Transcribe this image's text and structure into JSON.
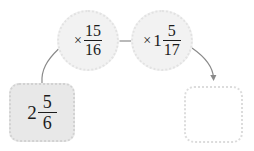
{
  "diagram": {
    "type": "function-machine",
    "title": "",
    "start": {
      "label": "2 5/6",
      "whole": "2",
      "numerator": "5",
      "denominator": "6"
    },
    "operations": [
      {
        "label": "× 15/16",
        "sign": "×",
        "whole": "",
        "numerator": "15",
        "denominator": "16"
      },
      {
        "label": "×1 5/17",
        "sign": "×",
        "whole": "1",
        "numerator": "5",
        "denominator": "17"
      }
    ],
    "answer": {
      "value": "",
      "placeholder": ""
    },
    "colors": {
      "circle_fill": "#f2f2f2",
      "circle_border": "#e2e2e2",
      "start_box_fill": "#e8e8e8",
      "start_box_border": "#d2d2d2",
      "answer_box_fill": "#ffffff",
      "answer_box_border": "#dcdcdc",
      "connector": "#8a8a8a",
      "text": "#1c1c1c"
    }
  }
}
